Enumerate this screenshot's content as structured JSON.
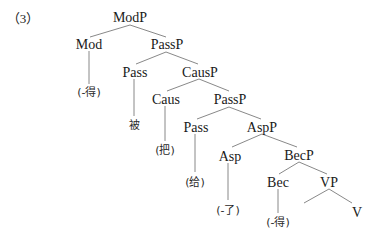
{
  "example_label": "（3）",
  "nodes": {
    "modp": "ModP",
    "mod": "Mod",
    "passp1": "PassP",
    "pass1": "Pass",
    "causp": "CausP",
    "caus": "Caus",
    "passp2": "PassP",
    "pass2": "Pass",
    "aspp": "AspP",
    "asp": "Asp",
    "becp": "BecP",
    "bec": "Bec",
    "vp": "VP",
    "v": "V"
  },
  "leaves": {
    "mod_leaf": "(-得)",
    "pass1_leaf": "被",
    "caus_leaf": "(把)",
    "pass2_leaf": "(给)",
    "asp_leaf": "(-了)",
    "bec_leaf": "(-得)"
  },
  "colors": {
    "text": "#1a1a1a",
    "edges": "#6a6a6a",
    "background": "#ffffff"
  }
}
